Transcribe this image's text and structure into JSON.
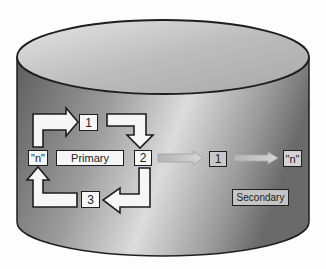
{
  "diagram": {
    "container": {
      "shape": "cylinder",
      "label": ""
    },
    "primary": {
      "label": "Primary",
      "cycle_nodes": [
        "1",
        "2",
        "3",
        "\"n\""
      ]
    },
    "secondary": {
      "label": "Secondary",
      "chain_nodes": [
        "1",
        "\"n\""
      ]
    },
    "colors": {
      "cylinder_dark": "#6e6e6e",
      "cylinder_light": "#d9d9d9",
      "box_fill": "#f6f6f6",
      "outline": "#1e1e1e",
      "transfer_arrow": "#bdbdbd"
    }
  }
}
